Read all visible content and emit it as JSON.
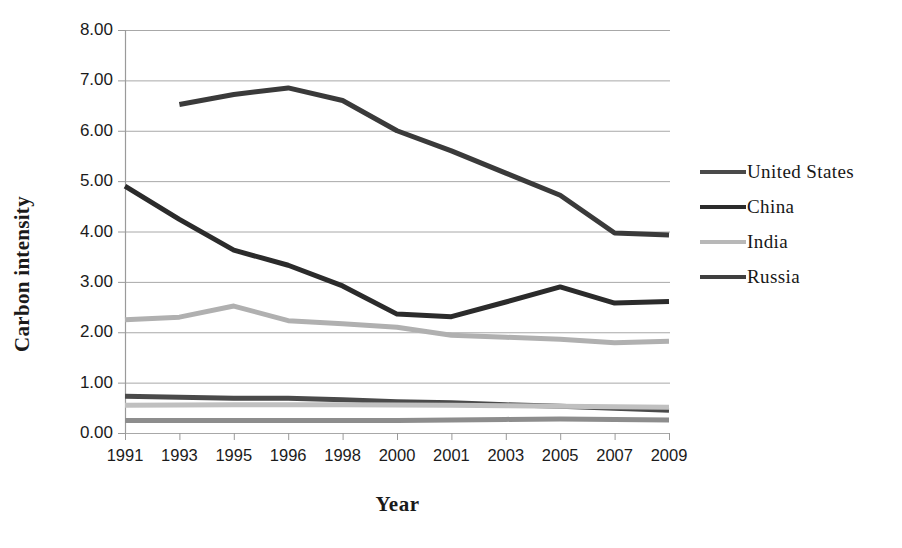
{
  "chart_data": {
    "type": "line",
    "title": "",
    "xlabel": "Year",
    "ylabel": "Carbon intensity",
    "categories": [
      "1991",
      "1993",
      "1995",
      "1996",
      "1998",
      "2000",
      "2001",
      "2003",
      "2005",
      "2007",
      "2009"
    ],
    "ylim": [
      0,
      8
    ],
    "ytick_labels": [
      "0.00",
      "1.00",
      "2.00",
      "3.00",
      "4.00",
      "5.00",
      "6.00",
      "7.00",
      "8.00"
    ],
    "ytick_values": [
      0,
      1,
      2,
      3,
      4,
      5,
      6,
      7,
      8
    ],
    "grid": true,
    "legend_position": "right",
    "series": [
      {
        "name": "United States",
        "color": "#4a4a4a",
        "width": 5,
        "values": [
          0.73,
          0.71,
          0.69,
          0.69,
          0.66,
          0.62,
          0.6,
          0.56,
          0.53,
          0.49,
          0.45
        ]
      },
      {
        "name": "China",
        "color": "#2b2b2b",
        "width": 5,
        "values": [
          4.9,
          4.24,
          3.63,
          3.33,
          2.92,
          2.36,
          2.31,
          2.6,
          2.9,
          2.58,
          2.61
        ]
      },
      {
        "name": "India",
        "color": "#b0b0b0",
        "width": 5,
        "values": [
          2.25,
          2.3,
          2.52,
          2.23,
          2.17,
          2.1,
          1.94,
          1.9,
          1.86,
          1.79,
          1.82
        ]
      },
      {
        "name": "Russia",
        "color": "#3a3a3a",
        "width": 5,
        "values": [
          null,
          6.52,
          6.72,
          6.85,
          6.6,
          6.0,
          5.6,
          5.16,
          4.72,
          3.97,
          3.93
        ]
      },
      {
        "name": "series-secondary-light",
        "color": "#c0c0c0",
        "width": 5,
        "values": [
          0.55,
          0.555,
          0.56,
          0.56,
          0.56,
          0.555,
          0.55,
          0.54,
          0.53,
          0.52,
          0.51
        ]
      },
      {
        "name": "series-secondary-mid",
        "color": "#8d8d8d",
        "width": 5,
        "values": [
          0.25,
          0.25,
          0.25,
          0.25,
          0.25,
          0.25,
          0.26,
          0.27,
          0.28,
          0.27,
          0.26
        ]
      }
    ],
    "legend_entries": [
      {
        "label": "United States",
        "color": "#4a4a4a"
      },
      {
        "label": "China",
        "color": "#2b2b2b"
      },
      {
        "label": "India",
        "color": "#b8b8b8"
      },
      {
        "label": "Russia",
        "color": "#3f3f3f"
      }
    ],
    "axis_color": "#9a9a9a",
    "grid_color": "#a8a8a8"
  }
}
